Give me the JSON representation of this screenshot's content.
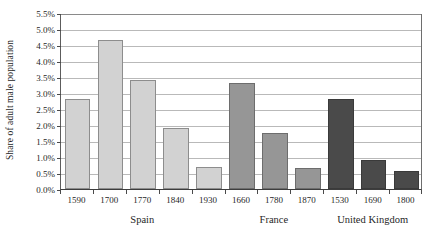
{
  "chart_data": {
    "type": "bar",
    "title": "",
    "subtitle": "",
    "xlabel": "",
    "ylabel": "Share of adult male population",
    "ylim": [
      0,
      5.5
    ],
    "ytick_step": 0.5,
    "grid": true,
    "legend": "none",
    "y_tick_labels": [
      "5.5%",
      "5.0%",
      "4.5%",
      "4.0%",
      "3.5%",
      "3.0%",
      "2.5%",
      "2.0%",
      "1.5%",
      "1.0%",
      "0.5%",
      "0.0%"
    ],
    "y_tick_values": [
      5.5,
      5.0,
      4.5,
      4.0,
      3.5,
      3.0,
      2.5,
      2.0,
      1.5,
      1.0,
      0.5,
      0.0
    ],
    "categories": [
      "1590",
      "1700",
      "1770",
      "1840",
      "1930",
      "1660",
      "1780",
      "1870",
      "1530",
      "1690",
      "1800"
    ],
    "values": [
      2.8,
      4.65,
      3.4,
      1.9,
      0.7,
      3.3,
      1.75,
      0.65,
      2.8,
      0.9,
      0.55
    ],
    "groups": [
      {
        "name": "Spain",
        "color": "#d2d2d2",
        "categories": [
          "1590",
          "1700",
          "1770",
          "1840",
          "1930"
        ],
        "values": [
          2.8,
          4.65,
          3.4,
          1.9,
          0.7
        ]
      },
      {
        "name": "France",
        "color": "#969696",
        "categories": [
          "1660",
          "1780",
          "1870"
        ],
        "values": [
          3.3,
          1.75,
          0.65
        ]
      },
      {
        "name": "United Kingdom",
        "color": "#4a4a4a",
        "categories": [
          "1530",
          "1690",
          "1800"
        ],
        "values": [
          2.8,
          0.9,
          0.55
        ]
      }
    ]
  }
}
